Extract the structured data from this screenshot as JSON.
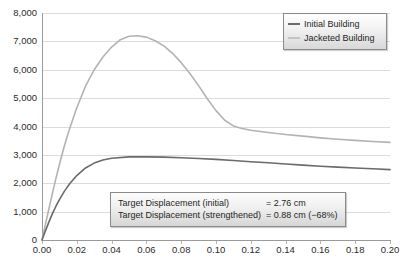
{
  "chart_data": {
    "type": "line",
    "title": "",
    "xlabel": "",
    "ylabel": "",
    "xlim": [
      0.0,
      0.2
    ],
    "ylim": [
      0,
      8000
    ],
    "grid": true,
    "legend_position": "top-right",
    "x_ticks": [
      "0.00",
      "0.02",
      "0.04",
      "0.06",
      "0.08",
      "0.10",
      "0.12",
      "0.14",
      "0.16",
      "0.18",
      "0.20"
    ],
    "y_ticks": [
      "0",
      "1,000",
      "2,000",
      "3,000",
      "4,000",
      "5,000",
      "6,000",
      "7,000",
      "8,000"
    ],
    "series": [
      {
        "name": "Initial Building",
        "color": "#6b6b6b",
        "x": [
          0.0,
          0.002,
          0.004,
          0.006,
          0.008,
          0.01,
          0.013,
          0.016,
          0.02,
          0.025,
          0.03,
          0.035,
          0.04,
          0.05,
          0.06,
          0.07,
          0.08,
          0.09,
          0.1,
          0.11,
          0.12,
          0.13,
          0.14,
          0.15,
          0.16,
          0.17,
          0.18,
          0.19,
          0.2
        ],
        "values": [
          0,
          330,
          640,
          930,
          1190,
          1420,
          1730,
          1990,
          2270,
          2540,
          2710,
          2820,
          2880,
          2930,
          2930,
          2920,
          2900,
          2870,
          2840,
          2800,
          2760,
          2720,
          2680,
          2640,
          2600,
          2570,
          2540,
          2510,
          2480
        ]
      },
      {
        "name": "Jacketed Building",
        "color": "#b3b3b3",
        "x": [
          0.0,
          0.002,
          0.004,
          0.006,
          0.008,
          0.01,
          0.013,
          0.016,
          0.02,
          0.025,
          0.03,
          0.035,
          0.04,
          0.045,
          0.05,
          0.055,
          0.06,
          0.065,
          0.07,
          0.075,
          0.08,
          0.085,
          0.09,
          0.095,
          0.1,
          0.105,
          0.11,
          0.115,
          0.12,
          0.13,
          0.14,
          0.15,
          0.16,
          0.17,
          0.18,
          0.19,
          0.2
        ],
        "values": [
          0,
          560,
          1110,
          1650,
          2170,
          2660,
          3350,
          3950,
          4660,
          5420,
          6000,
          6450,
          6800,
          7060,
          7180,
          7200,
          7150,
          7020,
          6840,
          6580,
          6250,
          5870,
          5440,
          4980,
          4560,
          4220,
          4020,
          3930,
          3870,
          3790,
          3720,
          3660,
          3600,
          3550,
          3510,
          3470,
          3440
        ]
      }
    ],
    "annotations": [
      {
        "label": "Target Displacement (initial)",
        "value": "= 2.76 cm"
      },
      {
        "label": "Target Displacement (strengthened)",
        "value": "= 0.88 cm (−68%)"
      }
    ]
  }
}
